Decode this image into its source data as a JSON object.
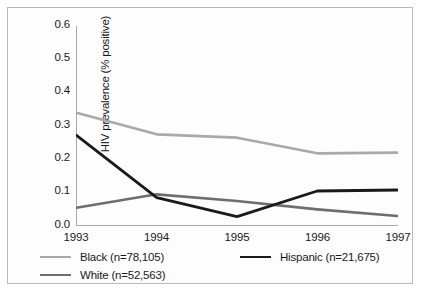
{
  "chart_data": {
    "type": "line",
    "title": "",
    "xlabel": "",
    "ylabel": "HIV prevalence (% positive)",
    "categories": [
      "1993",
      "1994",
      "1995",
      "1996",
      "1997"
    ],
    "x": [
      1993,
      1994,
      1995,
      1996,
      1997
    ],
    "xlim": [
      1993,
      1997
    ],
    "ylim": [
      0.0,
      0.6
    ],
    "yticks": [
      "0.0",
      "0.1",
      "0.2",
      "0.3",
      "0.4",
      "0.5",
      "0.6"
    ],
    "ytick_values": [
      0.0,
      0.1,
      0.2,
      0.3,
      0.4,
      0.5,
      0.6
    ],
    "grid": false,
    "legend_position": "below-axes",
    "series": [
      {
        "name": "Black (n=78,105)",
        "label_short": "Black",
        "n": "78,105",
        "color": "#a9a9a9",
        "values": [
          0.34,
          0.275,
          0.265,
          0.218,
          0.22
        ]
      },
      {
        "name": "White (n=52,563)",
        "label_short": "White",
        "n": "52,563",
        "color": "#6e6e6e",
        "values": [
          0.055,
          0.095,
          0.075,
          0.05,
          0.03
        ]
      },
      {
        "name": "Hispanic (n=21,675)",
        "label_short": "Hispanic",
        "n": "21,675",
        "color": "#1a1a1a",
        "values": [
          0.272,
          0.085,
          0.028,
          0.105,
          0.108
        ]
      }
    ]
  },
  "axes": {
    "y_label": "HIV prevalence (% positive)",
    "y_ticks": [
      "0.6",
      "0.5",
      "0.4",
      "0.3",
      "0.2",
      "0.1",
      "0.0"
    ],
    "x_ticks": [
      "1993",
      "1994",
      "1995",
      "1996",
      "1997"
    ],
    "axis_color": "#aaaaaa"
  },
  "legend": {
    "items": [
      {
        "label": "Black (n=78,105)",
        "color": "#a9a9a9"
      },
      {
        "label": "White (n=52,563)",
        "color": "#6e6e6e"
      },
      {
        "label": "Hispanic (n=21,675)",
        "color": "#1a1a1a"
      }
    ]
  }
}
